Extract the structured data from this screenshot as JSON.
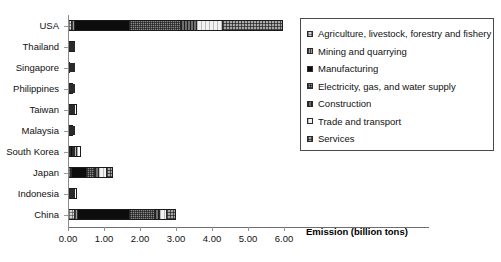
{
  "chart_data": {
    "type": "bar",
    "orientation": "horizontal",
    "stacked": true,
    "title": "",
    "subtitle": "",
    "xlabel": "Emission (billion tons)",
    "ylabel": "",
    "xlim": [
      0.0,
      6.0
    ],
    "xticks": [
      "0.00",
      "1.00",
      "2.00",
      "3.00",
      "4.00",
      "5.00",
      "6.00"
    ],
    "xtick_values": [
      0,
      1,
      2,
      3,
      4,
      5,
      6
    ],
    "grid": false,
    "legend_position": "right-inside",
    "categories": [
      "USA",
      "Thailand",
      "Singapore",
      "Philippines",
      "Taiwan",
      "Malaysia",
      "South Korea",
      "Japan",
      "Indonesia",
      "China"
    ],
    "series": [
      {
        "name": "Agriculture, livestock, forestry and fishery",
        "pattern": "p-agri",
        "values": [
          0.07,
          0.005,
          0.002,
          0.004,
          0.004,
          0.004,
          0.01,
          0.03,
          0.012,
          0.15
        ]
      },
      {
        "name": "Mining and quarrying",
        "pattern": "p-mining",
        "values": [
          0.04,
          0.003,
          0.001,
          0.002,
          0.003,
          0.003,
          0.01,
          0.02,
          0.008,
          0.06
        ]
      },
      {
        "name": "Manufacturing",
        "pattern": "p-manu",
        "values": [
          1.55,
          0.08,
          0.02,
          0.05,
          0.09,
          0.05,
          0.11,
          0.46,
          0.09,
          1.52
        ]
      },
      {
        "name": "Electricity, gas, and water supply",
        "pattern": "p-elec",
        "values": [
          1.45,
          0.06,
          0.018,
          0.03,
          0.08,
          0.04,
          0.1,
          0.23,
          0.06,
          0.72
        ]
      },
      {
        "name": "Construction",
        "pattern": "p-constr",
        "values": [
          0.45,
          0.01,
          0.004,
          0.008,
          0.015,
          0.01,
          0.03,
          0.09,
          0.02,
          0.14
        ]
      },
      {
        "name": "Trade and transport",
        "pattern": "p-trade",
        "values": [
          0.72,
          0.02,
          0.008,
          0.015,
          0.025,
          0.018,
          0.05,
          0.25,
          0.03,
          0.18
        ]
      },
      {
        "name": "Services",
        "pattern": "p-serv",
        "values": [
          1.68,
          0.022,
          0.007,
          0.016,
          0.028,
          0.02,
          0.06,
          0.17,
          0.03,
          0.23
        ]
      }
    ],
    "totals": [
      5.96,
      0.2,
      0.06,
      0.125,
      0.245,
      0.145,
      0.37,
      1.25,
      0.25,
      3.0
    ]
  },
  "legend": {
    "items": [
      {
        "label": "Agriculture, livestock, forestry and fishery",
        "pattern": "p-agri"
      },
      {
        "label": "Mining and quarrying",
        "pattern": "p-mining"
      },
      {
        "label": "Manufacturing",
        "pattern": "p-manu"
      },
      {
        "label": "Electricity, gas, and water supply",
        "pattern": "p-elec"
      },
      {
        "label": "Construction",
        "pattern": "p-constr"
      },
      {
        "label": "Trade and transport",
        "pattern": "p-trade"
      },
      {
        "label": "Services",
        "pattern": "p-serv"
      }
    ]
  },
  "colors": {
    "axis": "#6d6d6d",
    "text": "#111111",
    "legend_border": "#4a4a4a",
    "bar_outline": "#1b1b1b",
    "background": "#ffffff"
  }
}
